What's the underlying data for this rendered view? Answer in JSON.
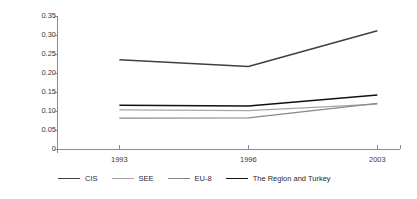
{
  "chart_data": {
    "type": "line",
    "title": "",
    "xlabel": "",
    "ylabel": "Concentration index",
    "categories": [
      "1993",
      "1996",
      "2003"
    ],
    "x": [
      1993,
      1996,
      2003
    ],
    "ylim": [
      0,
      0.35
    ],
    "xlim": [
      1993,
      2003
    ],
    "grid": false,
    "legend_position": "bottom",
    "y_ticks": [
      "0.35",
      "0.30",
      "0.25",
      "0.20",
      "0.15",
      "0.10",
      "0.05",
      "0"
    ],
    "y_tick_values": [
      0.35,
      0.3,
      0.25,
      0.2,
      0.15,
      0.1,
      0.05,
      0
    ],
    "series": [
      {
        "name": "CIS",
        "values": [
          0.235,
          0.217,
          0.311
        ],
        "color": "#404040",
        "width": 1.6
      },
      {
        "name": "SEE",
        "values": [
          0.103,
          0.101,
          0.118
        ],
        "color": "#a6a6a6",
        "width": 1.2
      },
      {
        "name": "EU-8",
        "values": [
          0.081,
          0.082,
          0.12
        ],
        "color": "#888888",
        "width": 1.2
      },
      {
        "name": "The Region and Turkey",
        "values": [
          0.115,
          0.113,
          0.142
        ],
        "color": "#111111",
        "width": 1.6
      }
    ]
  },
  "axes": {
    "axis_color": "#8c8c8c",
    "label_color": "#3a3a3a"
  }
}
